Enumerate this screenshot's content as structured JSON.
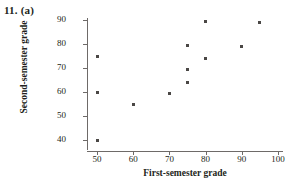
{
  "figure": {
    "item_label": "11. (a)"
  },
  "chart_data": {
    "type": "scatter",
    "title": "",
    "xlabel": "First-semester grade",
    "ylabel": "Second-semester grade",
    "xlim": [
      45,
      102
    ],
    "ylim": [
      36,
      92
    ],
    "xticks": [
      50,
      60,
      70,
      80,
      90,
      100
    ],
    "yticks": [
      40,
      50,
      60,
      70,
      80,
      90
    ],
    "xtick_labels": [
      "50",
      "60",
      "70",
      "80",
      "90",
      "100"
    ],
    "ytick_labels": [
      "40",
      "50",
      "60",
      "70",
      "80",
      "90"
    ],
    "grid": false,
    "legend": null,
    "marker": "square",
    "marker_color": "#4a4745",
    "axis_color": "#6e6a68",
    "points": [
      {
        "x": 50,
        "y": 75
      },
      {
        "x": 50,
        "y": 60
      },
      {
        "x": 50,
        "y": 40
      },
      {
        "x": 60,
        "y": 55
      },
      {
        "x": 70,
        "y": 59.5
      },
      {
        "x": 75,
        "y": 79.5
      },
      {
        "x": 75,
        "y": 69.5
      },
      {
        "x": 75,
        "y": 64
      },
      {
        "x": 80,
        "y": 89.5
      },
      {
        "x": 80,
        "y": 74
      },
      {
        "x": 90,
        "y": 79
      },
      {
        "x": 95,
        "y": 89
      }
    ]
  }
}
